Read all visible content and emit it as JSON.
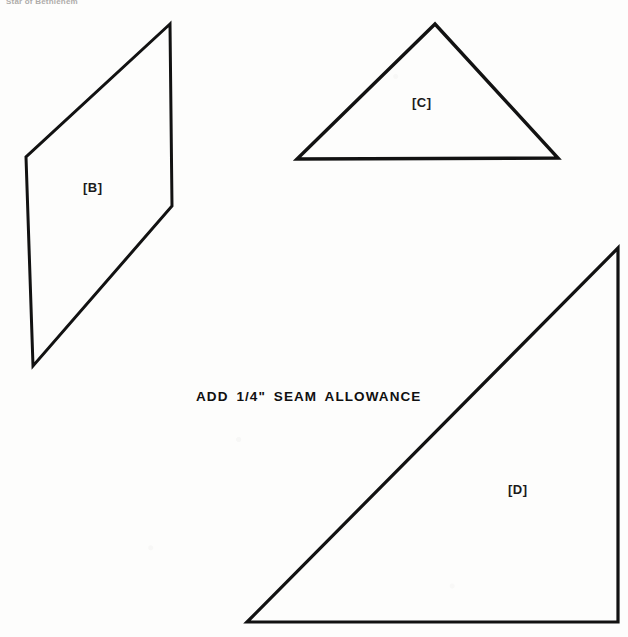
{
  "document": {
    "header_text": "Star of Bethlehem",
    "background_color": "#fdfdfc",
    "ink_color": "#101010"
  },
  "instructions": {
    "seam_allowance_note": "ADD 1/4\" SEAM ALLOWANCE"
  },
  "pieces": [
    {
      "id": "B",
      "label": "[B]",
      "shape": "parallelogram",
      "points": "170,24 26,157 33,366 172,206",
      "label_position": {
        "x": 83,
        "y": 180
      }
    },
    {
      "id": "C",
      "label": "[C]",
      "shape": "triangle",
      "points": "435,24 297,159 558,158",
      "label_position": {
        "x": 412,
        "y": 95
      }
    },
    {
      "id": "D",
      "label": "[D]",
      "shape": "right-triangle",
      "points": "618,248 618,622 247,622",
      "label_position": {
        "x": 508,
        "y": 482
      }
    }
  ],
  "style": {
    "stroke_color": "#121212",
    "stroke_width": 3,
    "fill": "none"
  }
}
